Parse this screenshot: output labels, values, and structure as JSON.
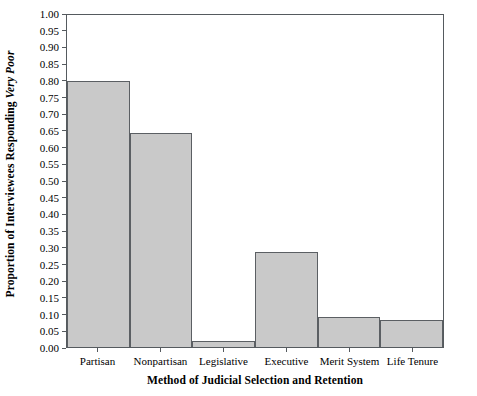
{
  "chart_data": {
    "type": "bar",
    "title": "",
    "xlabel": "Method of Judicial Selection and Retention",
    "ylabel_plain": "Proportion of Interviewees Responding",
    "ylabel_italic": "Very Poor",
    "categories": [
      "Partisan",
      "Nonpartisan",
      "Legislative",
      "Executive",
      "Merit System",
      "Life Tenure"
    ],
    "values": [
      0.795,
      0.64,
      0.018,
      0.285,
      0.09,
      0.08
    ],
    "ylim": [
      0.0,
      1.0
    ],
    "ytick_step": 0.05,
    "ytick_labels": [
      "0.00",
      "0.05",
      "0.10",
      "0.15",
      "0.20",
      "0.25",
      "0.30",
      "0.35",
      "0.40",
      "0.45",
      "0.50",
      "0.55",
      "0.60",
      "0.65",
      "0.70",
      "0.75",
      "0.80",
      "0.85",
      "0.90",
      "0.95",
      "1.00"
    ],
    "grid": false,
    "legend": false,
    "legend_position": "none",
    "bar_fill_color": "#c9c9c9",
    "bar_edge_color": "#5b5f63",
    "axis_color": "#555a5e",
    "background_color": "#ffffff"
  }
}
